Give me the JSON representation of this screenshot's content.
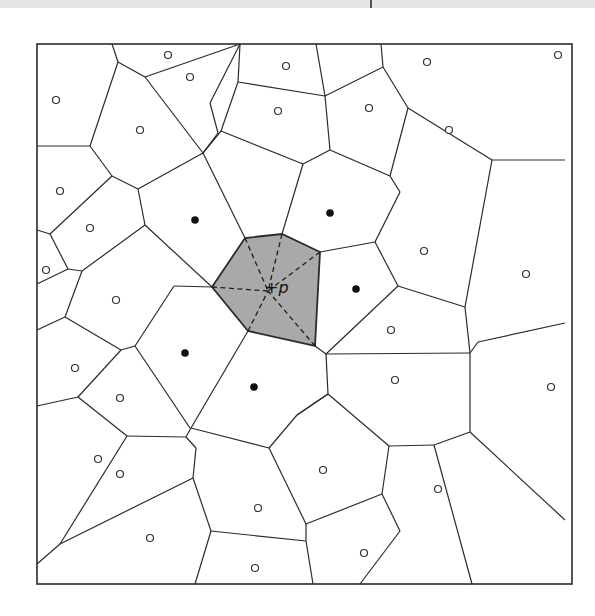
{
  "diagram": {
    "type": "voronoi-diagram",
    "query_point": {
      "label": "+p",
      "plus": "+",
      "name": "p",
      "x": 270,
      "y": 287
    },
    "colors": {
      "highlight_cell": "#a9a9a9",
      "edges": "#2b2b2b",
      "background": "#ffffff"
    },
    "frame": {
      "x": 37,
      "y": 44,
      "width": 535,
      "height": 540
    },
    "highlighted_cell": [
      [
        212,
        287
      ],
      [
        245,
        238
      ],
      [
        282,
        234
      ],
      [
        320,
        252
      ],
      [
        315,
        346
      ],
      [
        248,
        331
      ]
    ],
    "dashed_lines": [
      [
        [
          212,
          287
        ],
        [
          268,
          291
        ]
      ],
      [
        [
          245,
          238
        ],
        [
          268,
          291
        ]
      ],
      [
        [
          282,
          234
        ],
        [
          268,
          291
        ]
      ],
      [
        [
          320,
          252
        ],
        [
          268,
          291
        ]
      ],
      [
        [
          315,
          346
        ],
        [
          268,
          291
        ]
      ],
      [
        [
          248,
          331
        ],
        [
          268,
          291
        ]
      ]
    ],
    "natural_neighbors": [
      {
        "x": 195,
        "y": 220
      },
      {
        "x": 330,
        "y": 213
      },
      {
        "x": 356,
        "y": 289
      },
      {
        "x": 185,
        "y": 353
      },
      {
        "x": 254,
        "y": 387
      }
    ],
    "sites": [
      {
        "x": 168,
        "y": 55
      },
      {
        "x": 286,
        "y": 66
      },
      {
        "x": 190,
        "y": 77
      },
      {
        "x": 427,
        "y": 62
      },
      {
        "x": 558,
        "y": 55
      },
      {
        "x": 56,
        "y": 100
      },
      {
        "x": 140,
        "y": 130
      },
      {
        "x": 278,
        "y": 111
      },
      {
        "x": 369,
        "y": 108
      },
      {
        "x": 449,
        "y": 130
      },
      {
        "x": 60,
        "y": 191
      },
      {
        "x": 90,
        "y": 228
      },
      {
        "x": 46,
        "y": 270
      },
      {
        "x": 116,
        "y": 300
      },
      {
        "x": 424,
        "y": 251
      },
      {
        "x": 526,
        "y": 274
      },
      {
        "x": 391,
        "y": 330
      },
      {
        "x": 75,
        "y": 368
      },
      {
        "x": 120,
        "y": 398
      },
      {
        "x": 395,
        "y": 380
      },
      {
        "x": 551,
        "y": 387
      },
      {
        "x": 98,
        "y": 459
      },
      {
        "x": 120,
        "y": 474
      },
      {
        "x": 323,
        "y": 470
      },
      {
        "x": 438,
        "y": 489
      },
      {
        "x": 150,
        "y": 538
      },
      {
        "x": 258,
        "y": 508
      },
      {
        "x": 364,
        "y": 553
      },
      {
        "x": 255,
        "y": 568
      }
    ],
    "edges": [
      [
        [
          112,
          44
        ],
        [
          118,
          62
        ]
      ],
      [
        [
          118,
          62
        ],
        [
          145,
          77
        ]
      ],
      [
        [
          145,
          77
        ],
        [
          240,
          44
        ]
      ],
      [
        [
          118,
          62
        ],
        [
          90,
          146
        ]
      ],
      [
        [
          37,
          146
        ],
        [
          90,
          146
        ]
      ],
      [
        [
          90,
          146
        ],
        [
          112,
          176
        ]
      ],
      [
        [
          112,
          176
        ],
        [
          138,
          189
        ]
      ],
      [
        [
          138,
          189
        ],
        [
          203,
          153
        ]
      ],
      [
        [
          203,
          153
        ],
        [
          145,
          77
        ]
      ],
      [
        [
          203,
          153
        ],
        [
          218,
          133
        ]
      ],
      [
        [
          218,
          133
        ],
        [
          210,
          103
        ]
      ],
      [
        [
          210,
          103
        ],
        [
          240,
          44
        ]
      ],
      [
        [
          240,
          44
        ],
        [
          238,
          82
        ]
      ],
      [
        [
          238,
          82
        ],
        [
          325,
          96
        ]
      ],
      [
        [
          325,
          96
        ],
        [
          316,
          44
        ]
      ],
      [
        [
          238,
          82
        ],
        [
          221,
          131
        ]
      ],
      [
        [
          221,
          131
        ],
        [
          203,
          153
        ]
      ],
      [
        [
          325,
          96
        ],
        [
          383,
          67
        ]
      ],
      [
        [
          383,
          67
        ],
        [
          381,
          44
        ]
      ],
      [
        [
          383,
          67
        ],
        [
          408,
          108
        ]
      ],
      [
        [
          408,
          108
        ],
        [
          492,
          160
        ]
      ],
      [
        [
          492,
          160
        ],
        [
          565,
          160
        ]
      ],
      [
        [
          325,
          96
        ],
        [
          330,
          150
        ]
      ],
      [
        [
          330,
          150
        ],
        [
          303,
          164
        ]
      ],
      [
        [
          221,
          131
        ],
        [
          303,
          164
        ]
      ],
      [
        [
          303,
          164
        ],
        [
          282,
          234
        ]
      ],
      [
        [
          330,
          150
        ],
        [
          390,
          176
        ]
      ],
      [
        [
          390,
          176
        ],
        [
          408,
          108
        ]
      ],
      [
        [
          390,
          176
        ],
        [
          400,
          192
        ]
      ],
      [
        [
          37,
          230
        ],
        [
          50,
          234
        ]
      ],
      [
        [
          50,
          234
        ],
        [
          112,
          176
        ]
      ],
      [
        [
          138,
          189
        ],
        [
          145,
          225
        ]
      ],
      [
        [
          145,
          225
        ],
        [
          212,
          287
        ]
      ],
      [
        [
          203,
          153
        ],
        [
          245,
          238
        ]
      ],
      [
        [
          50,
          234
        ],
        [
          68,
          269
        ]
      ],
      [
        [
          68,
          269
        ],
        [
          37,
          284
        ]
      ],
      [
        [
          68,
          269
        ],
        [
          82,
          271
        ]
      ],
      [
        [
          82,
          271
        ],
        [
          145,
          225
        ]
      ],
      [
        [
          82,
          271
        ],
        [
          65,
          317
        ]
      ],
      [
        [
          65,
          317
        ],
        [
          37,
          330
        ]
      ],
      [
        [
          65,
          317
        ],
        [
          121,
          350
        ]
      ],
      [
        [
          121,
          350
        ],
        [
          135,
          346
        ]
      ],
      [
        [
          135,
          346
        ],
        [
          174,
          286
        ]
      ],
      [
        [
          174,
          286
        ],
        [
          212,
          287
        ]
      ],
      [
        [
          320,
          252
        ],
        [
          375,
          242
        ]
      ],
      [
        [
          375,
          242
        ],
        [
          400,
          192
        ]
      ],
      [
        [
          375,
          242
        ],
        [
          398,
          286
        ]
      ],
      [
        [
          398,
          286
        ],
        [
          465,
          307
        ]
      ],
      [
        [
          465,
          307
        ],
        [
          492,
          160
        ]
      ],
      [
        [
          398,
          286
        ],
        [
          326,
          354
        ]
      ],
      [
        [
          326,
          354
        ],
        [
          315,
          346
        ]
      ],
      [
        [
          326,
          354
        ],
        [
          470,
          353
        ]
      ],
      [
        [
          470,
          353
        ],
        [
          465,
          307
        ]
      ],
      [
        [
          470,
          353
        ],
        [
          478,
          342
        ]
      ],
      [
        [
          478,
          342
        ],
        [
          565,
          323
        ]
      ],
      [
        [
          326,
          354
        ],
        [
          328,
          394
        ]
      ],
      [
        [
          328,
          394
        ],
        [
          297,
          415
        ]
      ],
      [
        [
          470,
          353
        ],
        [
          470,
          432
        ]
      ],
      [
        [
          470,
          432
        ],
        [
          434,
          445
        ]
      ],
      [
        [
          470,
          432
        ],
        [
          565,
          520
        ]
      ],
      [
        [
          248,
          331
        ],
        [
          191,
          428
        ]
      ],
      [
        [
          135,
          346
        ],
        [
          190,
          428
        ]
      ],
      [
        [
          121,
          350
        ],
        [
          78,
          397
        ]
      ],
      [
        [
          78,
          397
        ],
        [
          37,
          406
        ]
      ],
      [
        [
          78,
          397
        ],
        [
          127,
          436
        ]
      ],
      [
        [
          127,
          436
        ],
        [
          186,
          437
        ]
      ],
      [
        [
          186,
          437
        ],
        [
          191,
          428
        ]
      ],
      [
        [
          191,
          428
        ],
        [
          269,
          448
        ]
      ],
      [
        [
          269,
          448
        ],
        [
          297,
          415
        ]
      ],
      [
        [
          297,
          415
        ],
        [
          328,
          394
        ]
      ],
      [
        [
          328,
          394
        ],
        [
          389,
          446
        ]
      ],
      [
        [
          389,
          446
        ],
        [
          434,
          445
        ]
      ],
      [
        [
          269,
          448
        ],
        [
          306,
          524
        ]
      ],
      [
        [
          306,
          524
        ],
        [
          382,
          494
        ]
      ],
      [
        [
          382,
          494
        ],
        [
          389,
          446
        ]
      ],
      [
        [
          186,
          437
        ],
        [
          196,
          448
        ]
      ],
      [
        [
          196,
          448
        ],
        [
          193,
          478
        ]
      ],
      [
        [
          127,
          436
        ],
        [
          60,
          544
        ]
      ],
      [
        [
          60,
          544
        ],
        [
          37,
          564
        ]
      ],
      [
        [
          60,
          544
        ],
        [
          193,
          478
        ]
      ],
      [
        [
          193,
          478
        ],
        [
          211,
          531
        ]
      ],
      [
        [
          211,
          531
        ],
        [
          195,
          584
        ]
      ],
      [
        [
          211,
          531
        ],
        [
          306,
          541
        ]
      ],
      [
        [
          306,
          541
        ],
        [
          306,
          524
        ]
      ],
      [
        [
          306,
          541
        ],
        [
          313,
          584
        ]
      ],
      [
        [
          382,
          494
        ],
        [
          400,
          531
        ]
      ],
      [
        [
          400,
          531
        ],
        [
          360,
          584
        ]
      ],
      [
        [
          434,
          445
        ],
        [
          472,
          584
        ]
      ]
    ]
  }
}
